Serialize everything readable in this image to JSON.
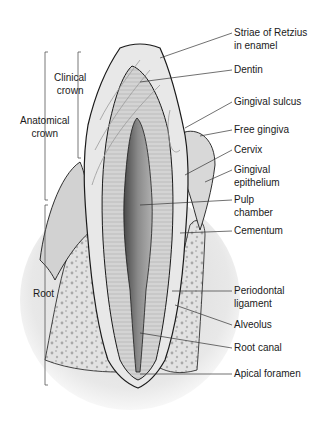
{
  "figure": {
    "left_labels": [
      {
        "id": "clinical-crown",
        "lines": [
          "Clinical",
          "crown"
        ]
      },
      {
        "id": "anatomical-crown",
        "lines": [
          "Anatomical",
          "crown"
        ]
      },
      {
        "id": "root",
        "lines": [
          "Root"
        ]
      }
    ],
    "right_labels": [
      {
        "id": "striae-of-retzius",
        "lines": [
          "Striae of Retzius",
          "in enamel"
        ]
      },
      {
        "id": "dentin",
        "lines": [
          "Dentin"
        ]
      },
      {
        "id": "gingival-sulcus",
        "lines": [
          "Gingival sulcus"
        ]
      },
      {
        "id": "free-gingiva",
        "lines": [
          "Free gingiva"
        ]
      },
      {
        "id": "cervix",
        "lines": [
          "Cervix"
        ]
      },
      {
        "id": "gingival-epithelium",
        "lines": [
          "Gingival",
          "epithelium"
        ]
      },
      {
        "id": "pulp-chamber",
        "lines": [
          "Pulp",
          "chamber"
        ]
      },
      {
        "id": "cementum",
        "lines": [
          "Cementum"
        ]
      },
      {
        "id": "periodontal-ligament",
        "lines": [
          "Periodontal",
          "ligament"
        ]
      },
      {
        "id": "alveolus",
        "lines": [
          "Alveolus"
        ]
      },
      {
        "id": "root-canal",
        "lines": [
          "Root canal"
        ]
      },
      {
        "id": "apical-foramen",
        "lines": [
          "Apical foramen"
        ]
      }
    ],
    "colors": {
      "enamel": "#e6e6e6",
      "dentin": "#cfcfcf",
      "pulp": "#6a6a6a",
      "gingiva": "#d9d9d9",
      "bone": "#e4e4e4",
      "bone_spots": "#a8a8a8",
      "outline": "#1a1a1a"
    }
  }
}
